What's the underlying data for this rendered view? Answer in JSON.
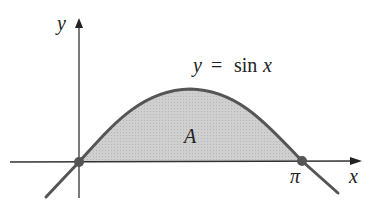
{
  "diagram": {
    "curve_label_var": "y",
    "curve_label_eq": "=",
    "curve_label_fn": "sin",
    "curve_label_arg": "x",
    "region_label": "A",
    "x_axis_label": "x",
    "y_axis_label": "y",
    "pi_label": "π",
    "colors": {
      "curve": "#555555",
      "fill": "#c8c8c8",
      "axes": "#333333",
      "points": "#555555"
    },
    "points": [
      {
        "name": "origin",
        "x": 0,
        "y": 0
      },
      {
        "name": "pi",
        "x": "π",
        "y": 0
      }
    ]
  }
}
